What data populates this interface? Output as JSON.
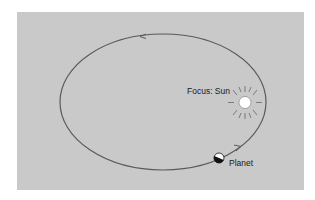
{
  "diagram": {
    "labels": {
      "sun": "Focus: Sun",
      "planet": "Planet"
    },
    "colors": {
      "background": "#c9c9c9",
      "orbit": "#555555",
      "sun_fill": "#ffffff",
      "planet_dark": "#111111",
      "planet_light": "#ffffff"
    }
  }
}
